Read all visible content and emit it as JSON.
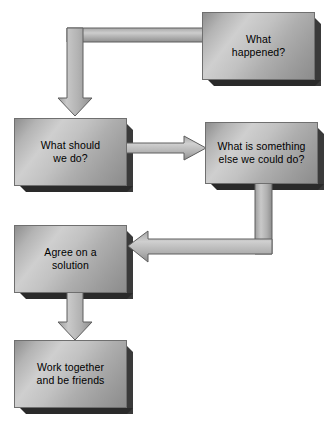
{
  "diagram": {
    "background_color": "#ffffff",
    "box_fill_light": "#cfcfcf",
    "box_fill_dark": "#8c8c8c",
    "box_border_color": "#6f6f6f",
    "shadow_color": "#2a2a2a",
    "arrow_fill_light": "#d0d0d0",
    "arrow_fill_dark": "#8a8a8a",
    "arrow_outline_color": "#5a5a5a",
    "text_color": "#000000",
    "nodes": [
      {
        "id": "what-happened",
        "label": "What\nhappened?",
        "x": 202,
        "y": 12,
        "w": 113,
        "h": 68
      },
      {
        "id": "what-should-we-do",
        "label": "What should\nwe do?",
        "x": 14,
        "y": 118,
        "w": 113,
        "h": 68
      },
      {
        "id": "what-is-something-else",
        "label": "What is something\nelse we could do?",
        "x": 205,
        "y": 122,
        "w": 113,
        "h": 62
      },
      {
        "id": "agree-on-a-solution",
        "label": "Agree on a\nsolution",
        "x": 14,
        "y": 225,
        "w": 113,
        "h": 68
      },
      {
        "id": "work-together",
        "label": "Work together\nand be friends",
        "x": 14,
        "y": 340,
        "w": 113,
        "h": 68
      }
    ],
    "connectors": [
      {
        "id": "happened-to-should",
        "from": "what-happened",
        "to": "what-should-we-do",
        "shape": "elbow-left-down",
        "direction": "down"
      },
      {
        "id": "should-to-something-else",
        "from": "what-should-we-do",
        "to": "what-is-something-else",
        "shape": "straight-horizontal",
        "direction": "right"
      },
      {
        "id": "something-else-to-agree",
        "from": "what-is-something-else",
        "to": "agree-on-a-solution",
        "shape": "elbow-down-left",
        "direction": "left"
      },
      {
        "id": "agree-to-work-together",
        "from": "agree-on-a-solution",
        "to": "work-together",
        "shape": "straight-vertical",
        "direction": "down"
      }
    ]
  }
}
